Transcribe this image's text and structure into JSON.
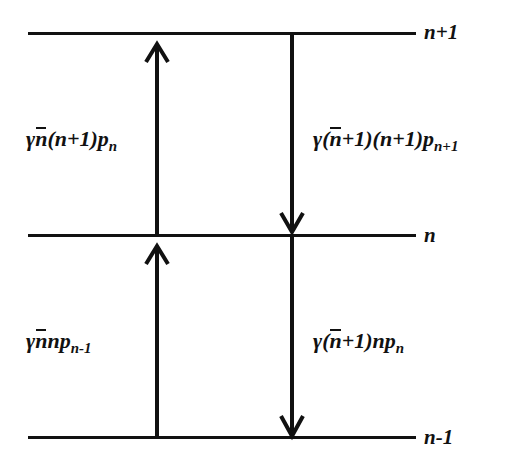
{
  "diagram": {
    "background_color": "#ffffff",
    "line_color": "#111111",
    "levels": [
      {
        "id": "level-n-plus-1",
        "label": "n+1",
        "y": 33
      },
      {
        "id": "level-n",
        "label": "n",
        "y": 235
      },
      {
        "id": "level-n-minus-1",
        "label": "n-1",
        "y": 437
      }
    ],
    "level_labels": {
      "top": "n+1",
      "middle": "n",
      "bottom": "n-1"
    },
    "rates": {
      "upper_left": {
        "text": "γ n̄(n+1)p_n",
        "gamma": "γ",
        "nbar": "n",
        "factor": "(n+1)",
        "p": "p",
        "p_subscript": "n",
        "direction": "up",
        "from": "n",
        "to": "n+1"
      },
      "upper_right": {
        "text": "γ(n̄+1)(n+1)p_{n+1}",
        "gamma": "γ",
        "open_paren": "(",
        "nbar": "n",
        "plus_one": "+1)",
        "factor": "(n+1)",
        "p": "p",
        "p_subscript": "n+1",
        "direction": "down",
        "from": "n+1",
        "to": "n"
      },
      "lower_left": {
        "text": "γ n̄ n p_{n-1}",
        "gamma": "γ",
        "nbar": "n",
        "factor": "n",
        "p": "p",
        "p_subscript": "n-1",
        "direction": "up",
        "from": "n-1",
        "to": "n"
      },
      "lower_right": {
        "text": "γ(n̄+1)n p_n",
        "gamma": "γ",
        "open_paren": "(",
        "nbar": "n",
        "plus_one": "+1)",
        "factor": "n",
        "p": "p",
        "p_subscript": "n",
        "direction": "down",
        "from": "n",
        "to": "n-1"
      }
    },
    "arrows": [
      {
        "id": "arrow-up-lower",
        "x": 157,
        "direction": "up",
        "from_y": 437,
        "to_y": 235
      },
      {
        "id": "arrow-up-upper",
        "x": 157,
        "direction": "up",
        "from_y": 235,
        "to_y": 33
      },
      {
        "id": "arrow-down-upper",
        "x": 292,
        "direction": "down",
        "from_y": 33,
        "to_y": 235
      },
      {
        "id": "arrow-down-lower",
        "x": 292,
        "direction": "down",
        "from_y": 235,
        "to_y": 437
      }
    ]
  }
}
